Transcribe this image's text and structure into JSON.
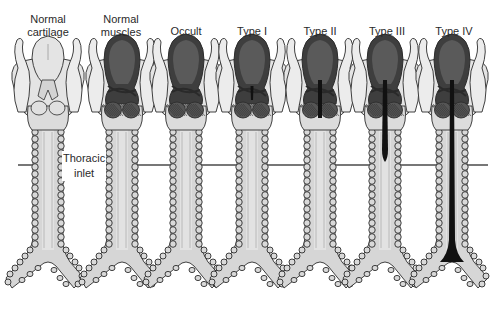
{
  "figure": {
    "colors": {
      "background": "#ffffff",
      "cartilage_light": "#e4e4e4",
      "cartilage_mid": "#cfcfcf",
      "muscle_dark": "#5a5a5a",
      "muscle_darker": "#3e3e3e",
      "outline": "#2c2c2c",
      "cleft_black": "#111111",
      "inlet_line": "#777777",
      "tube": "#d6d6d6",
      "ring": "#bdbdbd"
    },
    "columns": [
      {
        "id": "normal-cartilage",
        "label_lines": [
          "Normal",
          "cartilage"
        ],
        "style": "cartilage",
        "cleft": "none"
      },
      {
        "id": "normal-muscles",
        "label_lines": [
          "Normal",
          "muscles"
        ],
        "style": "muscle",
        "cleft": "none"
      },
      {
        "id": "occult",
        "label_lines": [
          "Occult"
        ],
        "style": "muscle",
        "cleft": "occult"
      },
      {
        "id": "type-i",
        "label_lines": [
          "Type I"
        ],
        "style": "muscle",
        "cleft": "type1"
      },
      {
        "id": "type-ii",
        "label_lines": [
          "Type II"
        ],
        "style": "muscle",
        "cleft": "type2"
      },
      {
        "id": "type-iii",
        "label_lines": [
          "Type III"
        ],
        "style": "muscle",
        "cleft": "type3"
      },
      {
        "id": "type-iv",
        "label_lines": [
          "Type IV"
        ],
        "style": "muscle",
        "cleft": "type4"
      }
    ],
    "thoracic_inlet": {
      "label_lines": [
        "Thoracic",
        "inlet"
      ]
    }
  }
}
